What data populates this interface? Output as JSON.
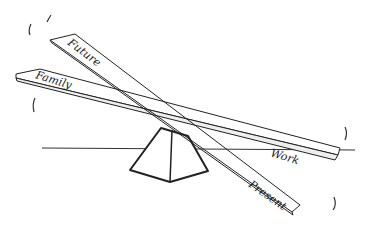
{
  "illustration": {
    "description": "Hand-drawn sketch of a seesaw with two crossed planks balanced on a pyramid fulcrum",
    "planks": [
      {
        "id": "family-work",
        "left_label": "Family",
        "right_label": "Work"
      },
      {
        "id": "future-present",
        "left_label": "Future",
        "right_label": "Present"
      }
    ],
    "colors": {
      "ink": "#222222",
      "background": "#ffffff"
    }
  }
}
